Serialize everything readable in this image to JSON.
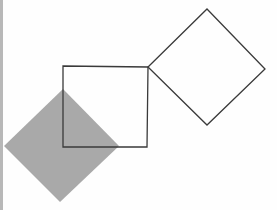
{
  "diagram": {
    "width": 277,
    "height": 210,
    "background": "#fefefe",
    "border_strip": {
      "color": "#b8b8b8",
      "width": 3
    },
    "shapes": [
      {
        "id": "square",
        "type": "square",
        "points": "63,66 148,67 147,147 63,147",
        "fill": "none",
        "stroke": "#3a3a3a",
        "stroke_width": 1.3
      },
      {
        "id": "outline-diamond",
        "type": "diamond",
        "points": "207,9 265,69 207,125 148,67",
        "fill": "none",
        "stroke": "#3a3a3a",
        "stroke_width": 1.3
      },
      {
        "id": "filled-diamond",
        "type": "diamond",
        "points": "63,89 119,146 60,202 4,146",
        "fill": "#a9a9a9",
        "stroke": "none",
        "stroke_width": 0
      }
    ]
  }
}
